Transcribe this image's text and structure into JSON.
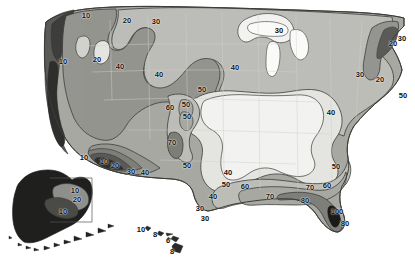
{
  "map": {
    "title": "United States contour map",
    "region_names": [
      "Contiguous United States",
      "Alaska",
      "Hawaii"
    ],
    "palette": {
      "background": "#ffffff",
      "level_0_lightest": "#f2f2f0",
      "level_1": "#e4e4e0",
      "level_2": "#d2d2cd",
      "level_3": "#bdbdb8",
      "level_4": "#a8a8a3",
      "level_5": "#949490",
      "level_6": "#7e7e7a",
      "level_7": "#666663",
      "level_8_darkest": "#3a3a38",
      "black_core": "#111111",
      "outline": "#3c3c3a",
      "state_border": "#cfcfca"
    },
    "contour_labels": [
      {
        "value": "10",
        "x": 86,
        "y": 16,
        "size": 7.5,
        "rot": 0,
        "area": "pacific-northwest"
      },
      {
        "value": "20",
        "x": 127,
        "y": 21,
        "size": 7.5,
        "rot": 0,
        "area": "northern-rockies"
      },
      {
        "value": "30",
        "x": 156,
        "y": 22,
        "size": 7.5,
        "rot": 0,
        "area": "northern-plains"
      },
      {
        "value": "30",
        "x": 279,
        "y": 31,
        "size": 7.5,
        "rot": 0,
        "area": "great-lakes-north"
      },
      {
        "value": "30",
        "x": 402,
        "y": 39,
        "size": 7.5,
        "rot": 0,
        "area": "canada-edge-east"
      },
      {
        "value": "20",
        "x": 393,
        "y": 44,
        "size": 7.5,
        "rot": 0,
        "area": "maine"
      },
      {
        "value": "10",
        "x": 63,
        "y": 62,
        "size": 7.5,
        "rot": 0,
        "area": "oregon"
      },
      {
        "value": "20",
        "x": 97,
        "y": 60,
        "size": 7.5,
        "rot": 0,
        "area": "idaho"
      },
      {
        "value": "40",
        "x": 120,
        "y": 67,
        "size": 7.5,
        "rot": 0,
        "area": "wyoming"
      },
      {
        "value": "40",
        "x": 159,
        "y": 75,
        "size": 7.5,
        "rot": 0,
        "area": "nebraska"
      },
      {
        "value": "40",
        "x": 235,
        "y": 68,
        "size": 7.5,
        "rot": 0,
        "area": "upper-midwest"
      },
      {
        "value": "30",
        "x": 360,
        "y": 75,
        "size": 7.5,
        "rot": 0,
        "area": "new-york"
      },
      {
        "value": "20",
        "x": 380,
        "y": 80,
        "size": 7.5,
        "rot": 0,
        "area": "southern-new-england"
      },
      {
        "value": "50",
        "x": 202,
        "y": 90,
        "size": 7.5,
        "rot": 0,
        "area": "central-plains"
      },
      {
        "value": "60",
        "x": 170,
        "y": 108,
        "size": 7.5,
        "rot": 0,
        "area": "colorado-west"
      },
      {
        "value": "50",
        "x": 186,
        "y": 105,
        "size": 7.5,
        "rot": 0,
        "area": "colorado-core-upper"
      },
      {
        "value": "50",
        "x": 187,
        "y": 117,
        "size": 7.5,
        "rot": 0,
        "area": "colorado-core-lower"
      },
      {
        "value": "50",
        "x": 403,
        "y": 96,
        "size": 7.5,
        "rot": 0,
        "area": "atlantic-offshore"
      },
      {
        "value": "40",
        "x": 331,
        "y": 113,
        "size": 7.5,
        "rot": 0,
        "area": "mid-atlantic"
      },
      {
        "value": "70",
        "x": 172,
        "y": 143,
        "size": 7.5,
        "rot": 0,
        "area": "new-mexico-high"
      },
      {
        "value": "10",
        "x": 84,
        "y": 158,
        "size": 7.5,
        "rot": 0,
        "area": "southern-california"
      },
      {
        "value": "10",
        "x": 104,
        "y": 162,
        "size": 7.5,
        "rot": 0,
        "area": "lower-colorado-river"
      },
      {
        "value": "20",
        "x": 115,
        "y": 166,
        "size": 7.5,
        "rot": 0,
        "area": "arizona-west"
      },
      {
        "value": "30",
        "x": 131,
        "y": 172,
        "size": 7.5,
        "rot": 0,
        "area": "arizona-south"
      },
      {
        "value": "40",
        "x": 145,
        "y": 173,
        "size": 7.5,
        "rot": 0,
        "area": "new-mexico-south"
      },
      {
        "value": "50",
        "x": 187,
        "y": 166,
        "size": 7.5,
        "rot": 0,
        "area": "texas-panhandle"
      },
      {
        "value": "40",
        "x": 228,
        "y": 173,
        "size": 7.5,
        "rot": 0,
        "area": "north-texas"
      },
      {
        "value": "50",
        "x": 226,
        "y": 185,
        "size": 7.5,
        "rot": 0,
        "area": "central-texas"
      },
      {
        "value": "60",
        "x": 245,
        "y": 187,
        "size": 7.5,
        "rot": 0,
        "area": "east-texas"
      },
      {
        "value": "40",
        "x": 213,
        "y": 197,
        "size": 7.5,
        "rot": 0,
        "area": "south-texas"
      },
      {
        "value": "30",
        "x": 200,
        "y": 209,
        "size": 7.5,
        "rot": 0,
        "area": "rio-grande-valley"
      },
      {
        "value": "70",
        "x": 270,
        "y": 197,
        "size": 7.5,
        "rot": 0,
        "area": "gulf-coast-louisiana"
      },
      {
        "value": "70",
        "x": 310,
        "y": 188,
        "size": 7.5,
        "rot": 0,
        "area": "gulf-coast-alabama"
      },
      {
        "value": "60",
        "x": 327,
        "y": 186,
        "size": 7.5,
        "rot": 0,
        "area": "georgia-south"
      },
      {
        "value": "50",
        "x": 336,
        "y": 167,
        "size": 7.5,
        "rot": 0,
        "area": "carolinas"
      },
      {
        "value": "80",
        "x": 305,
        "y": 201,
        "size": 7.5,
        "rot": 0,
        "area": "florida-panhandle"
      },
      {
        "value": "100",
        "x": 337,
        "y": 212,
        "size": 7.5,
        "rot": 0,
        "area": "florida-peninsula-core"
      },
      {
        "value": "80",
        "x": 345,
        "y": 224,
        "size": 7.5,
        "rot": 0,
        "area": "south-florida"
      },
      {
        "value": "10",
        "x": 75,
        "y": 191,
        "size": 7.5,
        "rot": 0,
        "area": "alaska-interior-north"
      },
      {
        "value": "20",
        "x": 77,
        "y": 200,
        "size": 7.5,
        "rot": 0,
        "area": "alaska-interior-south"
      },
      {
        "value": "10",
        "x": 63,
        "y": 212,
        "size": 7.5,
        "rot": 0,
        "area": "alaska-southwest"
      },
      {
        "value": "10",
        "x": 141,
        "y": 230,
        "size": 7.5,
        "rot": 0,
        "area": "hawaii-kauai"
      },
      {
        "value": "8",
        "x": 155,
        "y": 235,
        "size": 7.5,
        "rot": 0,
        "area": "hawaii-oahu"
      },
      {
        "value": "6",
        "x": 168,
        "y": 241,
        "size": 7.5,
        "rot": 0,
        "area": "hawaii-maui"
      },
      {
        "value": "8",
        "x": 172,
        "y": 252,
        "size": 7.5,
        "rot": 0,
        "area": "hawaii-big-island"
      },
      {
        "value": "30",
        "x": 205,
        "y": 219,
        "size": 7.5,
        "rot": 0,
        "area": "mexico-border-inset"
      }
    ]
  }
}
